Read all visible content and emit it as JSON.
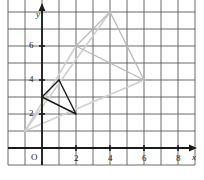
{
  "figure": {
    "kind": "coordinate-grid-dilation-diagram",
    "background_color": "#ffffff",
    "grid_color": "#5a5a5a",
    "axis_color": "#1a1a1a",
    "dark_shape_color": "#1a1a1a",
    "light_shape_color": "#b9b9b9"
  },
  "axes": {
    "x_axis_label": "x",
    "y_axis_label": "y",
    "origin_label": "O",
    "x_ticks": [
      {
        "value": 2,
        "label": "2"
      },
      {
        "value": 4,
        "label": "4"
      },
      {
        "value": 6,
        "label": "6"
      },
      {
        "value": 8,
        "label": "8"
      }
    ],
    "y_ticks": [
      {
        "value": 2,
        "label": "2"
      },
      {
        "value": 4,
        "label": "4"
      },
      {
        "value": 6,
        "label": "6"
      }
    ],
    "x_range": [
      -2,
      9
    ],
    "y_range": [
      -1,
      9
    ],
    "grid_spacing_units": 1
  },
  "chart_data": {
    "type": "scatter",
    "title": "",
    "xlabel": "x",
    "ylabel": "y",
    "xlim": [
      -2,
      9
    ],
    "ylim": [
      -1,
      9
    ],
    "grid": true,
    "legend": "none",
    "shapes": [
      {
        "name": "preimage-triangle",
        "style": "dark-solid",
        "color": "#1a1a1a",
        "closed": true,
        "points": [
          [
            0,
            3
          ],
          [
            1,
            4
          ],
          [
            2,
            2
          ]
        ]
      },
      {
        "name": "image-triangle",
        "style": "light-solid",
        "color": "#b9b9b9",
        "closed": true,
        "points": [
          [
            2,
            6
          ],
          [
            4,
            8
          ],
          [
            6,
            4
          ]
        ]
      }
    ],
    "rays": [
      {
        "name": "dilation-ray-through-a",
        "color": "#cfcfcf",
        "from": [
          -1,
          1
        ],
        "to": [
          4,
          8
        ]
      },
      {
        "name": "dilation-ray-through-b",
        "color": "#cfcfcf",
        "from": [
          -1,
          1
        ],
        "to": [
          2,
          6
        ]
      },
      {
        "name": "dilation-ray-through-c",
        "color": "#cfcfcf",
        "from": [
          -1,
          1
        ],
        "to": [
          6,
          4
        ]
      }
    ]
  }
}
